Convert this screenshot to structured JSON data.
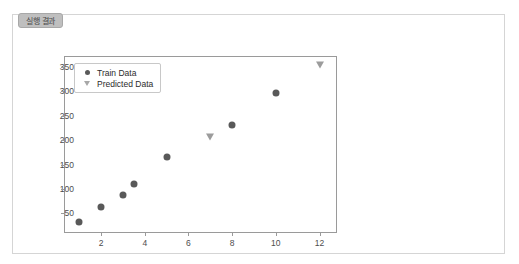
{
  "tab": {
    "label": "실행 결과"
  },
  "chart_data": {
    "type": "scatter",
    "title": "",
    "xlabel": "",
    "ylabel": "",
    "xlim": [
      0.3,
      12.8
    ],
    "ylim": [
      10,
      372
    ],
    "grid": false,
    "legend_position": "upper-left",
    "xticks": [
      2,
      4,
      6,
      8,
      10,
      12
    ],
    "yticks": [
      50,
      100,
      150,
      200,
      250,
      300,
      350
    ],
    "series": [
      {
        "name": "Train Data",
        "marker": "circle",
        "color": "#595959",
        "points": [
          {
            "x": 1,
            "y": 33
          },
          {
            "x": 2,
            "y": 63
          },
          {
            "x": 3,
            "y": 87
          },
          {
            "x": 3.5,
            "y": 110
          },
          {
            "x": 5,
            "y": 165
          },
          {
            "x": 8,
            "y": 230
          },
          {
            "x": 10,
            "y": 296
          }
        ]
      },
      {
        "name": "Predicted Data",
        "marker": "triangle-down",
        "color": "#9c9c9c",
        "points": [
          {
            "x": 7,
            "y": 207
          },
          {
            "x": 12,
            "y": 353
          }
        ]
      }
    ]
  }
}
